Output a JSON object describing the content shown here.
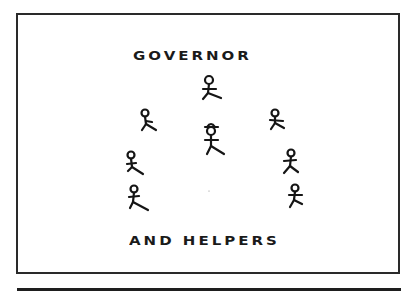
{
  "diagram": {
    "title": "GOVERNOR",
    "subtitle": "AND HELPERS",
    "figures": [
      {
        "role": "governor",
        "label": "stick-figure-governor",
        "x": 209,
        "y": 81,
        "hat": false
      },
      {
        "role": "governor-with-hat",
        "label": "stick-figure-center-hat",
        "x": 212,
        "y": 131,
        "hat": true
      },
      {
        "role": "helper",
        "label": "stick-figure-helper-left-upper",
        "x": 145,
        "y": 113,
        "hat": false
      },
      {
        "role": "helper",
        "label": "stick-figure-helper-right-upper",
        "x": 275,
        "y": 113,
        "hat": false
      },
      {
        "role": "helper",
        "label": "stick-figure-helper-left-mid",
        "x": 131,
        "y": 155,
        "hat": false
      },
      {
        "role": "helper",
        "label": "stick-figure-helper-left-low",
        "x": 134,
        "y": 189,
        "hat": false
      },
      {
        "role": "helper",
        "label": "stick-figure-helper-right-mid",
        "x": 291,
        "y": 154,
        "hat": false
      },
      {
        "role": "helper",
        "label": "stick-figure-helper-right-low",
        "x": 295,
        "y": 188,
        "hat": false
      }
    ],
    "colors": {
      "ink": "#151515",
      "background": "#ffffff"
    }
  }
}
